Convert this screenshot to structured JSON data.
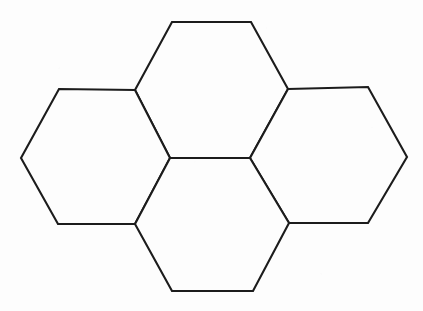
{
  "figure": {
    "caption": "",
    "background_color": "#fdfdfd",
    "stroke_color": "#1c1c1c",
    "fill_color": "#fdfdfd",
    "stroke_width": 2.1,
    "canvas": {
      "width": 423,
      "height": 311
    },
    "cell_count": 4,
    "cells": [
      {
        "name": "top-hexagon",
        "label": "Top hexagon",
        "points": "172,22 251,22 288,89 250,158 170,158 135,90"
      },
      {
        "name": "left-hexagon",
        "label": "Left hexagon",
        "points": "59,89 135,90 170,158 135,224 58,224 21,158"
      },
      {
        "name": "right-hexagon",
        "label": "Right hexagon",
        "points": "288,89 368,87 407,157 368,223 289,223 250,158"
      },
      {
        "name": "bottom-hexagon",
        "label": "Bottom hexagon",
        "points": "170,158 250,158 289,223 253,291 172,291 135,224"
      }
    ],
    "shared_edge": {
      "name": "central-edge",
      "label": "Central shared horizontal edge",
      "from": "170,158",
      "to": "250,158"
    },
    "vertices": [
      {
        "name": "top-left-apex",
        "x": 172,
        "y": 22
      },
      {
        "name": "top-right-apex",
        "x": 251,
        "y": 22
      },
      {
        "name": "upper-left-junction",
        "x": 135,
        "y": 90
      },
      {
        "name": "upper-right-junction",
        "x": 288,
        "y": 89
      },
      {
        "name": "left-upper-corner",
        "x": 59,
        "y": 89
      },
      {
        "name": "right-upper-corner",
        "x": 368,
        "y": 87
      },
      {
        "name": "left-apex",
        "x": 21,
        "y": 158
      },
      {
        "name": "right-apex",
        "x": 407,
        "y": 157
      },
      {
        "name": "center-left",
        "x": 170,
        "y": 158
      },
      {
        "name": "center-right",
        "x": 250,
        "y": 158
      },
      {
        "name": "lower-left-junction",
        "x": 135,
        "y": 224
      },
      {
        "name": "lower-right-junction",
        "x": 289,
        "y": 223
      },
      {
        "name": "left-lower-corner",
        "x": 58,
        "y": 224
      },
      {
        "name": "right-lower-corner",
        "x": 368,
        "y": 223
      },
      {
        "name": "bottom-left-apex",
        "x": 172,
        "y": 291
      },
      {
        "name": "bottom-right-apex",
        "x": 253,
        "y": 291
      }
    ]
  }
}
